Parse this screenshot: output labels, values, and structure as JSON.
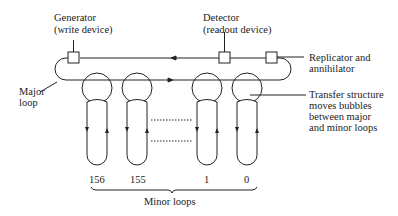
{
  "diagram": {
    "type": "magnetic bubble memory major/minor loop organization",
    "labels": {
      "generator_line1": "Generator",
      "generator_line2": "(write device)",
      "detector_line1": "Detector",
      "detector_line2": "(readout device)",
      "replicator_line1": "Replicator and",
      "replicator_line2": "annihilator",
      "major_line1": "Major",
      "major_line2": "loop",
      "transfer_line1": "Transfer structure",
      "transfer_line2": "moves bubbles",
      "transfer_line3": "between major",
      "transfer_line4": "and minor loops",
      "minor_loops": "Minor loops"
    },
    "minor_loop_numbers": [
      "156",
      "155",
      "1",
      "0"
    ],
    "stroke_color": "#222222",
    "background": "#ffffff"
  }
}
